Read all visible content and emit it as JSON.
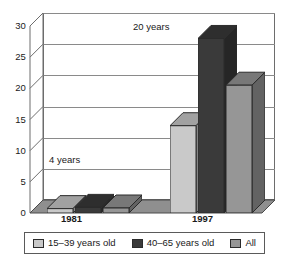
{
  "chart_data": {
    "type": "bar",
    "title": "",
    "subtitle": "",
    "xlabel": "",
    "ylabel": "",
    "categories": [
      "1981",
      "1997"
    ],
    "series": [
      {
        "name": "15–39 years old",
        "values": [
          0.7,
          14.0
        ],
        "color": "#c9c9c9"
      },
      {
        "name": "40–65 years old",
        "values": [
          0.9,
          28.0
        ],
        "color": "#3a3a3a"
      },
      {
        "name": "All",
        "values": [
          0.8,
          20.5
        ],
        "color": "#969696"
      }
    ],
    "ylim": [
      0,
      30
    ],
    "yticks": [
      "0",
      "5",
      "10",
      "15",
      "20",
      "25",
      "30"
    ],
    "ytick_values": [
      0,
      5,
      10,
      15,
      20,
      25,
      30
    ],
    "grid": true,
    "legend_position": "bottom",
    "three_d": true,
    "annotations": [
      {
        "text": "4 years",
        "near": "1981"
      },
      {
        "text": "20 years",
        "near": "1997"
      }
    ]
  },
  "legend": {
    "items": [
      {
        "label": "15–39 years old",
        "swatch": "#c9c9c9"
      },
      {
        "label": "40–65 years old",
        "swatch": "#3a3a3a"
      },
      {
        "label": "All",
        "swatch": "#969696"
      }
    ]
  },
  "axis": {
    "y": {
      "t0": "0",
      "t1": "5",
      "t2": "10",
      "t3": "15",
      "t4": "20",
      "t5": "25",
      "t6": "30"
    },
    "x": {
      "c0": "1981",
      "c1": "1997"
    }
  },
  "annotations": {
    "a0": "4 years",
    "a1": "20 years"
  },
  "colors": {
    "series_light": "#c9c9c9",
    "series_dark": "#3a3a3a",
    "series_mid": "#969696",
    "floor": "#8f8f8f",
    "grid": "#8a8a8a",
    "frame": "#6d6d6d",
    "background": "#ffffff"
  }
}
